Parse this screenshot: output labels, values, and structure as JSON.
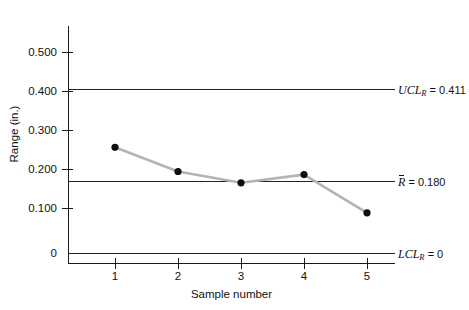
{
  "chart_data": {
    "type": "line",
    "title": "",
    "subtitle": "",
    "xlabel": "Sample number",
    "ylabel": "Range (in.)",
    "x": [
      1,
      2,
      3,
      4,
      5
    ],
    "categories": [
      "1",
      "2",
      "3",
      "4",
      "5"
    ],
    "series": [
      {
        "name": "Sample range",
        "values": [
          0.271,
          0.209,
          0.18,
          0.201,
          0.103
        ]
      }
    ],
    "xlim": [
      0,
      5.8
    ],
    "ylim": [
      0,
      0.58
    ],
    "xticks": [
      1,
      2,
      3,
      4,
      5
    ],
    "xticklabels": [
      "1",
      "2",
      "3",
      "4",
      "5"
    ],
    "yticks": [
      0,
      0.1,
      0.2,
      0.3,
      0.4,
      0.5
    ],
    "yticklabels": [
      "0",
      "0.100",
      "0.200",
      "0.300",
      "0.400",
      "0.500"
    ],
    "grid": false,
    "legend": false,
    "legend_position": "none",
    "marker_color": "#0d0d0d",
    "line_color": "#b4b4b4",
    "axis_color": "#1a1a1a",
    "control_lines": [
      {
        "id": "ucl",
        "value": 0.411,
        "label_prefix": "UCL",
        "label_subscript": "R",
        "label_value": "= 0.411",
        "label_text": "UCL_R = 0.411",
        "overbar": false,
        "color": "#232323"
      },
      {
        "id": "centerline",
        "value": 0.18,
        "label_prefix": "R",
        "label_subscript": "",
        "label_value": "= 0.180",
        "label_text": "R̄ = 0.180",
        "overbar": true,
        "color": "#232323"
      },
      {
        "id": "lcl",
        "value": 0,
        "label_prefix": "LCL",
        "label_subscript": "R",
        "label_value": "= 0",
        "label_text": "LCL_R = 0",
        "overbar": false,
        "color": "#232323"
      }
    ]
  }
}
